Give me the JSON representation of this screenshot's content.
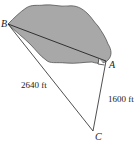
{
  "diagram": {
    "title": "",
    "points": {
      "B": {
        "label": "B",
        "x": 8,
        "y": 24
      },
      "A": {
        "label": "A",
        "x": 106,
        "y": 61
      },
      "C": {
        "label": "C",
        "x": 93,
        "y": 131
      }
    },
    "segments": [
      {
        "from": "B",
        "to": "A",
        "label": ""
      },
      {
        "from": "B",
        "to": "C",
        "label": "2640 ft"
      },
      {
        "from": "A",
        "to": "C",
        "label": "1600 ft"
      }
    ],
    "lake": {
      "fill": "#a8a8a8",
      "stroke": "#555555"
    },
    "right_angle_at": "A"
  },
  "labels": {
    "B": "B",
    "A": "A",
    "C": "C",
    "bc_length": "2640 ft",
    "ac_length": "1600 ft"
  }
}
